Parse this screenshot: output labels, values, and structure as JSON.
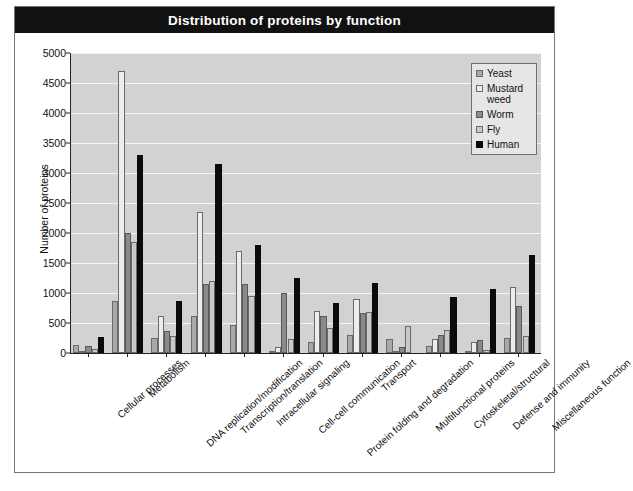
{
  "chart_data": {
    "type": "bar",
    "title": "Distribution of proteins by function",
    "xlabel": "",
    "ylabel": "Number of proteins",
    "ylim": [
      0,
      5000
    ],
    "y_ticks": [
      0,
      500,
      1000,
      1500,
      2000,
      2500,
      3000,
      3500,
      4000,
      4500,
      5000
    ],
    "grid": true,
    "legend_position": "top-right",
    "categories": [
      "Cellular processes",
      "Metabolism",
      "DNA replication/modification",
      "Transcription/translation",
      "Intracellular signaling",
      "Cell-cell communication",
      "Protein folding and degradation",
      "Transport",
      "Multifunctional proteins",
      "Cytoskeletal/structural",
      "Defense and immunity",
      "Miscellaneous function"
    ],
    "series": [
      {
        "name": "Yeast",
        "color": "#a8a8a8",
        "values": [
          130,
          870,
          250,
          620,
          460,
          40,
          180,
          300,
          240,
          110,
          20,
          250
        ]
      },
      {
        "name": "Mustard weed",
        "color": "#ededed",
        "values": [
          40,
          4700,
          620,
          2350,
          1700,
          100,
          700,
          900,
          30,
          230,
          180,
          1100
        ]
      },
      {
        "name": "Worm",
        "color": "#8a8a8a",
        "values": [
          110,
          2000,
          360,
          1150,
          1150,
          1000,
          620,
          660,
          100,
          300,
          220,
          790
        ]
      },
      {
        "name": "Fly",
        "color": "#c9c9c9",
        "values": [
          60,
          1850,
          280,
          1200,
          950,
          230,
          410,
          680,
          450,
          390,
          50,
          290
        ]
      },
      {
        "name": "Human",
        "color": "#0b0b0b",
        "values": [
          260,
          3300,
          870,
          3150,
          1800,
          1250,
          840,
          1170,
          0,
          930,
          1060,
          1630
        ]
      }
    ]
  }
}
